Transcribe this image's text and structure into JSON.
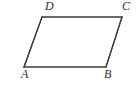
{
  "figure": {
    "kind": "geometry-diagram",
    "shape_name": "parallelogram",
    "background_color": "#ffffff",
    "stroke_color": "#3a3a3a",
    "stroke_width": 1.2,
    "label_color": "#2e2e2e",
    "vertices": [
      {
        "id": "A",
        "label": "A",
        "x": 24,
        "y": 67
      },
      {
        "id": "B",
        "label": "B",
        "x": 106,
        "y": 67
      },
      {
        "id": "C",
        "label": "C",
        "x": 122,
        "y": 17
      },
      {
        "id": "D",
        "label": "D",
        "x": 42,
        "y": 17
      }
    ],
    "edges": [
      {
        "id": "AB",
        "from": "A",
        "to": "B"
      },
      {
        "id": "BC",
        "from": "B",
        "to": "C"
      },
      {
        "id": "CD",
        "from": "C",
        "to": "D"
      },
      {
        "id": "DA",
        "from": "D",
        "to": "A"
      }
    ],
    "labels": {
      "A": "A",
      "B": "B",
      "C": "C",
      "D": "D"
    }
  }
}
